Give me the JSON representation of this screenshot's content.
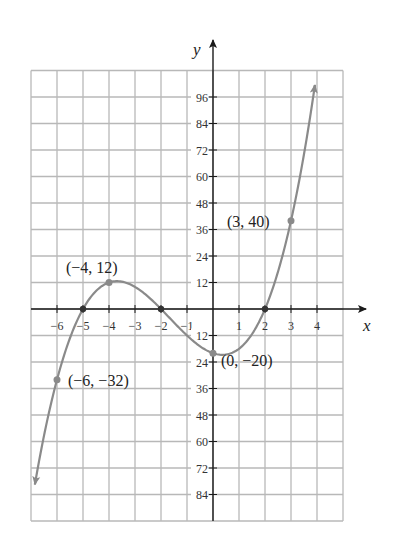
{
  "chart_data": {
    "type": "line",
    "title": "",
    "function": "f(x) = (x+5)(x+2)(x-2) = x^3 + 5x^2 - 4x - 20",
    "xlabel": "x",
    "ylabel": "y",
    "xlim": [
      -7,
      5
    ],
    "ylim": [
      -96,
      108
    ],
    "grid": true,
    "x_ticks": [
      -6,
      -5,
      -4,
      -3,
      -2,
      -1,
      1,
      2,
      3,
      4
    ],
    "x_tick_labels": [
      "−6",
      "−5",
      "−4",
      "−3",
      "−2",
      "−1",
      "1",
      "2",
      "3",
      "4"
    ],
    "y_ticks": [
      96,
      84,
      72,
      60,
      48,
      36,
      24,
      12,
      -12,
      -24,
      -36,
      -48,
      -60,
      -72,
      -84
    ],
    "y_tick_labels": [
      "96",
      "84",
      "72",
      "60",
      "48",
      "36",
      "24",
      "12",
      "12",
      "24",
      "36",
      "48",
      "60",
      "72",
      "84"
    ],
    "curve_domain": [
      -6.85,
      3.92
    ],
    "x_intercepts": [
      -5,
      -2,
      2
    ],
    "labeled_points": [
      {
        "x": -4,
        "y": 12,
        "label": "(−4, 12)"
      },
      {
        "x": 3,
        "y": 40,
        "label": "(3, 40)"
      },
      {
        "x": -6,
        "y": -32,
        "label": "(−6, −32)"
      },
      {
        "x": 0,
        "y": -20,
        "label": "(0, −20)"
      }
    ],
    "series": [
      {
        "name": "f(x)",
        "x": [
          -6.85,
          -6.5,
          -6,
          -5.5,
          -5,
          -4.5,
          -4,
          -3.5,
          -3,
          -2.5,
          -2,
          -1.5,
          -1,
          -0.5,
          0,
          0.5,
          1,
          1.5,
          2,
          2.5,
          3,
          3.5,
          3.92
        ],
        "values": [
          -79.4,
          -58.1,
          -32,
          -15.1,
          0,
          8.6,
          12,
          11.8,
          10,
          6.9,
          0,
          -6.1,
          -12,
          -16.9,
          -20,
          -20.6,
          -18,
          -11.4,
          0,
          16.9,
          40,
          69.4,
          101.3
        ],
        "color": "#8a8a8a"
      }
    ]
  },
  "colors": {
    "grid": "#b8b8b8",
    "axis": "#1a1a1a",
    "curve": "#8a8a8a",
    "point": "#8a8a8a"
  }
}
